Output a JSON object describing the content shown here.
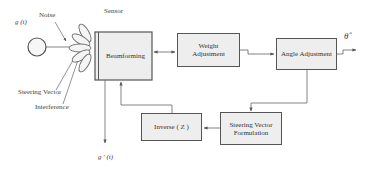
{
  "diagram": {
    "labels": {
      "source_signal": "g (t)",
      "noise": "Noise",
      "sensor": "Sensor",
      "steering_vector": "Steering Vector",
      "interference": "Interference",
      "output_signal": "g ′ (t)",
      "angle_estimate": "θ̂"
    },
    "blocks": {
      "beamforming": "Beamforming",
      "weight_adjustment_line1": "Weight",
      "weight_adjustment_line2": "Adjustment",
      "angle_adjustment": "Angle Adjustment",
      "inverse_z": "Inverse ( Z )",
      "steering_formulation_line1": "Steering Vector",
      "steering_formulation_line2": "Formulation"
    },
    "colors": {
      "box_fill": "#eeeeee",
      "stroke": "#555555",
      "text": "#333333"
    }
  }
}
